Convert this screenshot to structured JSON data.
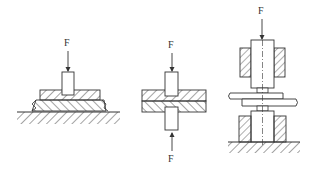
{
  "figures": [
    {
      "id": "single-sided",
      "force_labels": [
        "F"
      ],
      "description": "Single punch pressing stacked plates on a hatched base"
    },
    {
      "id": "double-sided",
      "force_labels": [
        "F",
        "F"
      ],
      "description": "Opposed punches pressing stacked plates from top and bottom"
    },
    {
      "id": "electrode-press",
      "force_labels": [
        "F"
      ],
      "description": "Upper and lower electrodes with hatched holders clamping overlapped sheets on ground"
    }
  ],
  "labels": {
    "fig1_force": "F",
    "fig2_force_top": "F",
    "fig2_force_bottom": "F",
    "fig3_force": "F"
  },
  "colors": {
    "line": "#333333",
    "background": "#ffffff"
  }
}
